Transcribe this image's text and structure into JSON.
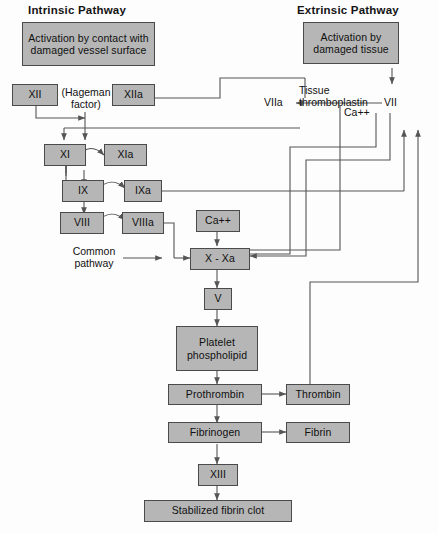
{
  "diagram": {
    "headers": {
      "intrinsic": "Intrinsic Pathway",
      "extrinsic": "Extrinsic Pathway"
    },
    "banners": {
      "intrinsic": "Activation by contact\nwith damaged\nvessel surface",
      "extrinsic": "Activation by\ndamaged tissue"
    },
    "labels": {
      "hageman": "(Hageman\nfactor)",
      "common_pathway": "Common\npathway",
      "tissue_thromboplastin": "Tissue thromboplastin",
      "calcium_extrinsic": "Ca++",
      "factor_vii": "VII",
      "factor_viia": "VIIa"
    },
    "nodes": {
      "xii": "XII",
      "xiia": "XIIa",
      "xi": "XI",
      "xia": "XIa",
      "ix": "IX",
      "ixa": "IXa",
      "viii": "VIII",
      "viiia": "VIIIa",
      "calcium": "Ca++",
      "x_xa": "X - Xa",
      "v": "V",
      "platelet": "Platelet\nphospholipid",
      "prothrombin": "Prothrombin",
      "thrombin": "Thrombin",
      "fibrinogen": "Fibrinogen",
      "fibrin": "Fibrin",
      "xiii": "XIII",
      "clot": "Stabilized fibrin clot"
    },
    "colors": {
      "box_fill": "#b6b6b6",
      "box_border": "#4a4a4a",
      "wire": "#555555",
      "text": "#101010",
      "background": "#fdfdfd"
    }
  }
}
